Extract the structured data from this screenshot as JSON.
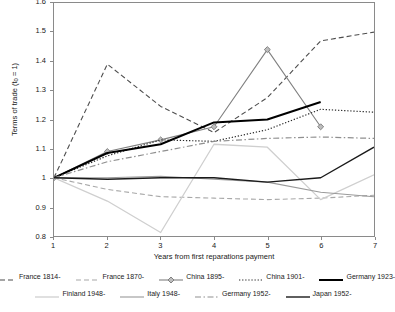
{
  "chart_data": {
    "type": "line",
    "title": "",
    "xlabel": "Years from first reparations payment",
    "ylabel": "Terms of trade (t0 = 1)",
    "ylabel_main": "Terms of trade (t",
    "ylabel_sub": "0",
    "ylabel_tail": " = 1)",
    "x": [
      1,
      2,
      3,
      4,
      5,
      6,
      7
    ],
    "xlim": [
      1,
      7
    ],
    "ylim": [
      0.8,
      1.6
    ],
    "xticks": [
      "1",
      "2",
      "3",
      "4",
      "5",
      "6",
      "7"
    ],
    "yticks": [
      "0.8",
      "0.9",
      "1",
      "1.1",
      "1.2",
      "1.3",
      "1.4",
      "1.5",
      "1.6"
    ],
    "ytick_values": [
      0.8,
      0.9,
      1.0,
      1.1,
      1.2,
      1.3,
      1.4,
      1.5,
      1.6
    ],
    "grid": false,
    "legend_position": "bottom",
    "series": [
      {
        "name": "France 1814-",
        "color": "#4d4d4d",
        "style": "dashed",
        "width": 1.1,
        "marker": "none",
        "values": [
          1.0,
          1.39,
          1.245,
          1.155,
          1.275,
          1.47,
          1.5
        ]
      },
      {
        "name": "France 1870-",
        "color": "#a8a8a8",
        "style": "dashed",
        "width": 1.1,
        "marker": "none",
        "values": [
          1.0,
          0.96,
          0.935,
          0.93,
          0.925,
          0.93,
          0.94
        ]
      },
      {
        "name": "China 1895-",
        "color": "#808080",
        "style": "solid",
        "width": 1.1,
        "marker": "diamond",
        "values": [
          1.0,
          1.09,
          1.13,
          1.175,
          1.44,
          1.175,
          null
        ]
      },
      {
        "name": "China 1901-",
        "color": "#2b2b2b",
        "style": "dotted",
        "width": 1.2,
        "marker": "none",
        "values": [
          1.0,
          1.075,
          1.13,
          1.125,
          1.165,
          1.235,
          1.225
        ]
      },
      {
        "name": "Germany 1923-",
        "color": "#000000",
        "style": "solid",
        "width": 2.0,
        "marker": "none",
        "values": [
          1.0,
          1.085,
          1.115,
          1.19,
          1.2,
          1.26,
          null
        ]
      },
      {
        "name": "Finland 1948-",
        "color": "#cfcfcf",
        "style": "solid",
        "width": 1.3,
        "marker": "none",
        "values": [
          1.0,
          0.92,
          0.812,
          1.115,
          1.105,
          0.925,
          1.01
        ]
      },
      {
        "name": "Italy 1948-",
        "color": "#9a9a9a",
        "style": "solid",
        "width": 1.1,
        "marker": "none",
        "values": [
          1.0,
          1.0,
          1.005,
          0.995,
          0.985,
          0.95,
          0.935
        ]
      },
      {
        "name": "Germany 1952-",
        "color": "#8f8f8f",
        "style": "dashdot",
        "width": 1.2,
        "marker": "none",
        "values": [
          1.0,
          1.055,
          1.09,
          1.125,
          1.135,
          1.14,
          1.135
        ]
      },
      {
        "name": "Japan 1952-",
        "color": "#1a1a1a",
        "style": "solid",
        "width": 1.4,
        "marker": "none",
        "values": [
          1.0,
          0.995,
          1.0,
          1.0,
          0.985,
          1.0,
          1.105
        ]
      }
    ]
  },
  "legend": {
    "rows": [
      [
        "France 1814-",
        "France 1870-",
        "China 1895-",
        "China 1901-",
        "Germany 1923-"
      ],
      [
        "Finland 1948-",
        "Italy 1948-",
        "Germany 1952-",
        "Japan 1952-"
      ]
    ]
  }
}
